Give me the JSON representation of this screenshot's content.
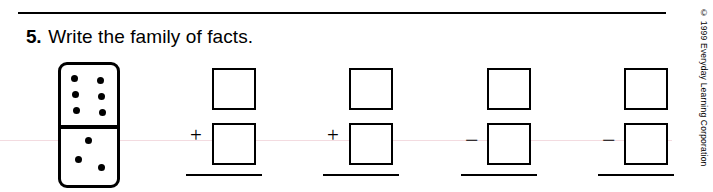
{
  "worksheet": {
    "problem_number": "5.",
    "prompt": "Write the family of facts.",
    "copyright": "© 1999 Everyday Learning Corporation"
  },
  "domino": {
    "name": "domino-tile",
    "top_pips": 6,
    "bottom_pips": 3,
    "top_pip_positions": [
      {
        "x": 13,
        "y": 12
      },
      {
        "x": 38,
        "y": 12
      },
      {
        "x": 13,
        "y": 27
      },
      {
        "x": 38,
        "y": 27
      },
      {
        "x": 13,
        "y": 42
      },
      {
        "x": 38,
        "y": 42
      }
    ],
    "bottom_pip_positions": [
      {
        "x": 26,
        "y": 74
      },
      {
        "x": 15,
        "y": 92
      },
      {
        "x": 38,
        "y": 99
      }
    ]
  },
  "number_models": [
    {
      "id": "fact-1",
      "operator": "+",
      "left": 168,
      "has_rule": true,
      "box_top_value": "",
      "box_bottom_value": ""
    },
    {
      "id": "fact-2",
      "operator": "+",
      "left": 305,
      "has_rule": true,
      "box_top_value": "",
      "box_bottom_value": ""
    },
    {
      "id": "fact-3",
      "operator": "−",
      "left": 443,
      "has_rule": true,
      "box_top_value": "",
      "box_bottom_value": ""
    },
    {
      "id": "fact-4",
      "operator": "−",
      "left": 580,
      "has_rule": true,
      "box_top_value": "",
      "box_bottom_value": ""
    }
  ]
}
